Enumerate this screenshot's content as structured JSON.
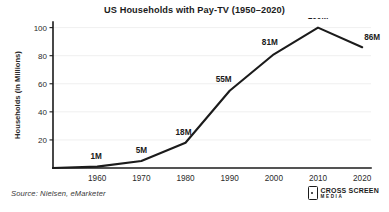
{
  "chart_data": {
    "type": "line",
    "title": "US Households with Pay-TV (1950–2020)",
    "xlabel": "",
    "ylabel": "Households (in Millions)",
    "x": [
      1950,
      1960,
      1970,
      1980,
      1990,
      2000,
      2010,
      2020
    ],
    "values": [
      0,
      1,
      5,
      18,
      55,
      81,
      100,
      86
    ],
    "point_labels": [
      "",
      "1M",
      "5M",
      "18M",
      "55M",
      "81M",
      "100M",
      "86M"
    ],
    "xticks": [
      "1960",
      "1970",
      "1980",
      "1990",
      "2000",
      "2010",
      "2020"
    ],
    "xtick_values": [
      1960,
      1970,
      1980,
      1990,
      2000,
      2010,
      2020
    ],
    "yticks": [
      "20",
      "40",
      "60",
      "80",
      "100"
    ],
    "ytick_values": [
      20,
      40,
      60,
      80,
      100
    ],
    "xlim": [
      1950,
      2022
    ],
    "ylim": [
      0,
      104
    ],
    "grid": true,
    "legend": false,
    "line_color": "#1b1b1b",
    "grid_color": "#ebebeb",
    "background_color": "#ffffff"
  },
  "footer": {
    "source": "Source: Nielsen, eMarketer",
    "logo_primary": "CROSS SCREEN",
    "logo_secondary": "MEDIA"
  }
}
